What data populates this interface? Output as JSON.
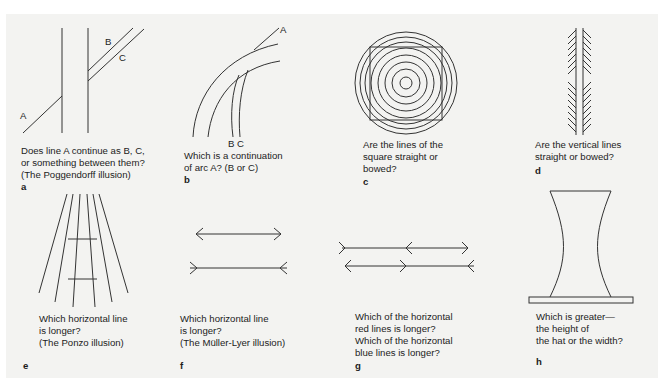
{
  "figures": [
    {
      "id": "a",
      "letter": "a",
      "point_labels": [
        "A",
        "B",
        "C"
      ],
      "caption": "Does line A continue as B, C,\nor something between them?\n(The Poggendorff illusion)"
    },
    {
      "id": "b",
      "letter": "b",
      "point_labels": [
        "A",
        "B C"
      ],
      "caption": "Which is a continuation\nof arc A? (B or C)"
    },
    {
      "id": "c",
      "letter": "c",
      "caption": "Are the lines of the\nsquare straight or\nbowed?"
    },
    {
      "id": "d",
      "letter": "d",
      "caption": "Are the vertical lines\nstraight or bowed?"
    },
    {
      "id": "e",
      "letter": "e",
      "caption": "Which horizontal line\nis longer?\n(The Ponzo illusion)"
    },
    {
      "id": "f",
      "letter": "f",
      "caption": "Which horizontal line\nis longer?\n(The Müller-Lyer illusion)"
    },
    {
      "id": "g",
      "letter": "g",
      "caption": "Which of the horizontal\nred lines is longer?\nWhich of the horizontal\nblue lines is longer?"
    },
    {
      "id": "h",
      "letter": "h",
      "caption": "Which is greater—\nthe height of\nthe hat or the width?"
    }
  ],
  "colors": {
    "background": "#f3f3f1",
    "line": "#333333",
    "text": "#1c1c1c"
  }
}
